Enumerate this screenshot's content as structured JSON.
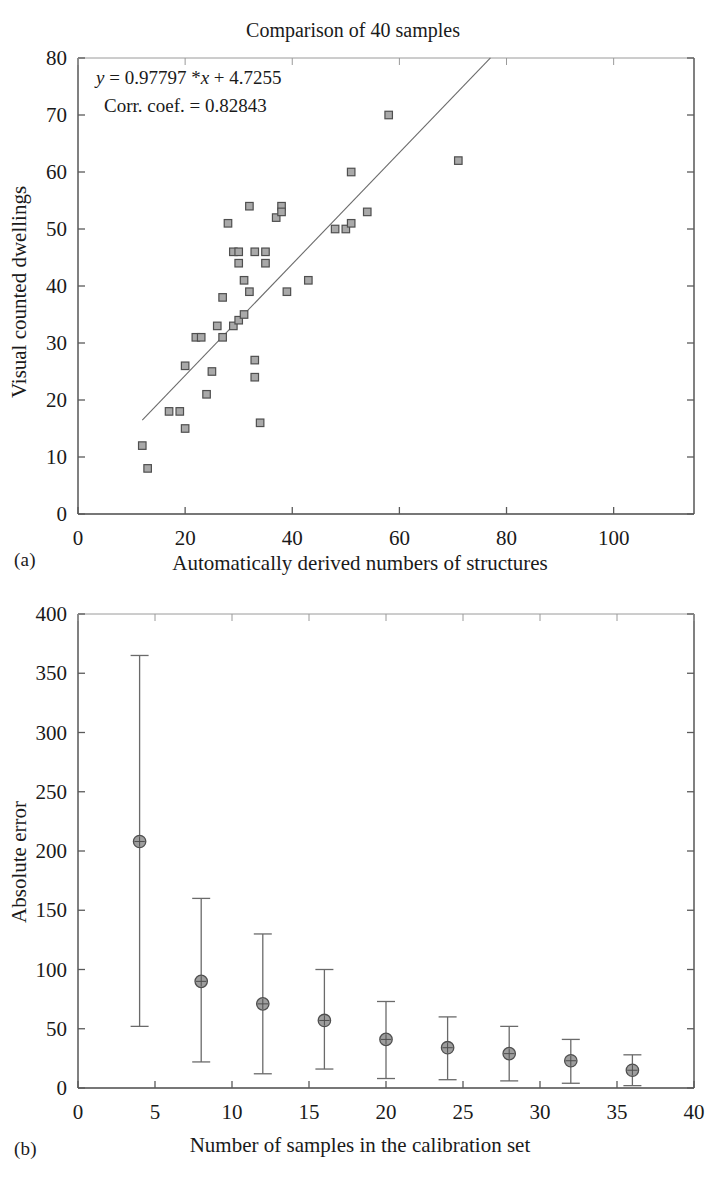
{
  "figure": {
    "panel_a_caption": "(a)",
    "panel_b_caption": "(b)"
  },
  "chart_data": [
    {
      "id": "panel-a",
      "type": "scatter",
      "title": "Comparison of 40 samples",
      "xlabel": "Automatically derived numbers of structures",
      "ylabel": "Visual counted dwellings",
      "xlim": [
        0,
        115
      ],
      "ylim": [
        0,
        80
      ],
      "xticks": [
        0,
        20,
        40,
        60,
        80,
        100
      ],
      "yticks": [
        0,
        10,
        20,
        30,
        40,
        50,
        60,
        70,
        80
      ],
      "xtick_labels": [
        "0",
        "20",
        "40",
        "60",
        "80",
        "100"
      ],
      "ytick_labels": [
        "0",
        "10",
        "20",
        "30",
        "40",
        "50",
        "60",
        "70",
        "80"
      ],
      "grid": false,
      "legend": "none",
      "annotations": [
        {
          "text": "y = 0.97797 *x + 4.7255",
          "x": 13,
          "y": 75
        },
        {
          "text": "Corr. coef. = 0.82843",
          "x": 15,
          "y": 70
        }
      ],
      "fit": {
        "slope": 0.97797,
        "intercept": 4.7255,
        "corr_coef": 0.82843,
        "x_start": 12,
        "x_end": 77
      },
      "points": [
        [
          12,
          12
        ],
        [
          13,
          8
        ],
        [
          17,
          18
        ],
        [
          19,
          18
        ],
        [
          20,
          15
        ],
        [
          20,
          26
        ],
        [
          22,
          31
        ],
        [
          23,
          31
        ],
        [
          24,
          21
        ],
        [
          25,
          25
        ],
        [
          26,
          33
        ],
        [
          27,
          31
        ],
        [
          27,
          38
        ],
        [
          28,
          51
        ],
        [
          29,
          46
        ],
        [
          30,
          46
        ],
        [
          30,
          44
        ],
        [
          29,
          33
        ],
        [
          30,
          34
        ],
        [
          31,
          35
        ],
        [
          31,
          41
        ],
        [
          32,
          54
        ],
        [
          32,
          39
        ],
        [
          33,
          46
        ],
        [
          33,
          27
        ],
        [
          33,
          24
        ],
        [
          34,
          16
        ],
        [
          35,
          46
        ],
        [
          35,
          44
        ],
        [
          37,
          52
        ],
        [
          38,
          54
        ],
        [
          38,
          53
        ],
        [
          39,
          39
        ],
        [
          43,
          41
        ],
        [
          48,
          50
        ],
        [
          50,
          50
        ],
        [
          51,
          51
        ],
        [
          51,
          60
        ],
        [
          54,
          53
        ],
        [
          58,
          70
        ],
        [
          71,
          62
        ]
      ]
    },
    {
      "id": "panel-b",
      "type": "errorbar",
      "title": "",
      "xlabel": "Number of samples in the calibration set",
      "ylabel": "Absolute error",
      "xlim": [
        0,
        40
      ],
      "ylim": [
        0,
        400
      ],
      "xticks": [
        0,
        5,
        10,
        15,
        20,
        25,
        30,
        35,
        40
      ],
      "yticks": [
        0,
        50,
        100,
        150,
        200,
        250,
        300,
        350,
        400
      ],
      "xtick_labels": [
        "0",
        "5",
        "10",
        "15",
        "20",
        "25",
        "30",
        "35",
        "40"
      ],
      "ytick_labels": [
        "0",
        "50",
        "100",
        "150",
        "200",
        "250",
        "300",
        "350",
        "400"
      ],
      "grid": false,
      "legend": "none",
      "x": [
        4,
        8,
        12,
        16,
        20,
        24,
        28,
        32,
        36
      ],
      "values": [
        208,
        90,
        71,
        57,
        41,
        34,
        29,
        23,
        15
      ],
      "err_low": [
        52,
        22,
        12,
        16,
        8,
        7,
        6,
        4,
        2
      ],
      "err_high": [
        365,
        160,
        130,
        100,
        73,
        60,
        52,
        41,
        28
      ]
    }
  ]
}
